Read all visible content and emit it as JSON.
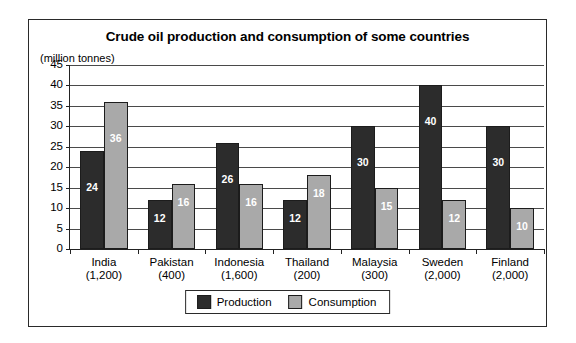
{
  "chart_data": {
    "type": "bar",
    "title": "Crude oil production and consumption of some countries",
    "subtitle": "(million tonnes)",
    "xlabel": "",
    "ylabel": "",
    "ylim": [
      0,
      45
    ],
    "ytick_step": 5,
    "yticks": [
      45,
      40,
      35,
      30,
      25,
      20,
      15,
      10,
      5,
      0
    ],
    "grid": true,
    "grid_axis": "y",
    "legend_position": "bottom-center",
    "categories": [
      "India",
      "Pakistan",
      "Indonesia",
      "Thailand",
      "Malaysia",
      "Sweden",
      "Finland"
    ],
    "category_sublabels": [
      "(1,200)",
      "(400)",
      "(1,600)",
      "(200)",
      "(300)",
      "(2,000)",
      "(2,000)"
    ],
    "series": [
      {
        "name": "Production",
        "color": "#2c2c2c",
        "values": [
          24,
          12,
          26,
          12,
          30,
          40,
          30
        ]
      },
      {
        "name": "Consumption",
        "color": "#a9a9a9",
        "values": [
          36,
          16,
          16,
          18,
          15,
          12,
          10
        ]
      }
    ]
  },
  "legend": {
    "items": [
      {
        "label": "Production",
        "swatch": "production"
      },
      {
        "label": "Consumption",
        "swatch": "consumption"
      }
    ]
  }
}
